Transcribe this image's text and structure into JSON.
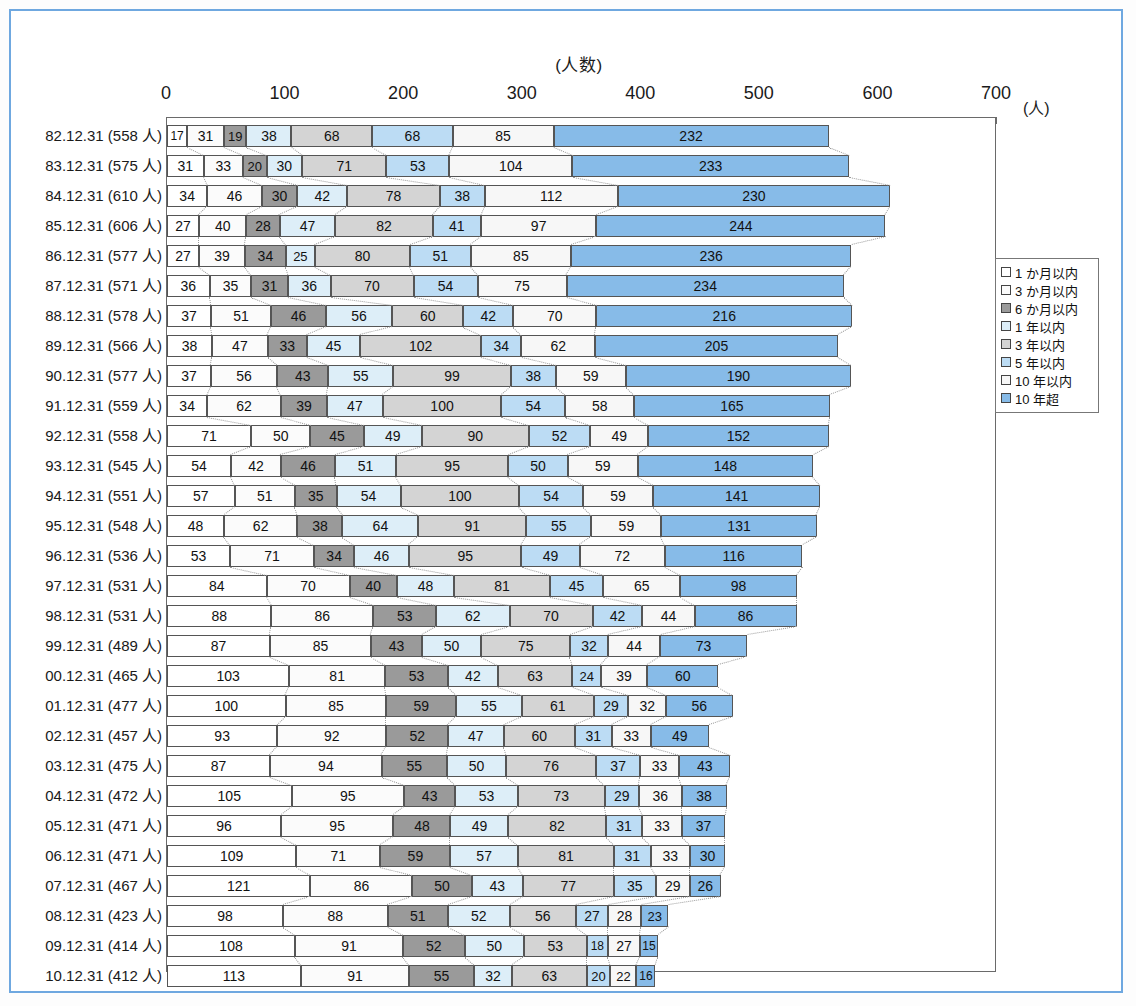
{
  "chart_data": {
    "type": "bar",
    "orientation": "horizontal",
    "stacked": true,
    "title": "(人数)",
    "xlabel": "(人)",
    "ylabel": "",
    "xlim": [
      0,
      700
    ],
    "xticks": [
      0,
      100,
      200,
      300,
      400,
      500,
      600,
      700
    ],
    "grid": false,
    "legend_position": "right",
    "series": [
      {
        "name": "1 か月以内",
        "color": "#ffffff"
      },
      {
        "name": "3 か月以内",
        "color": "#fbfbfb"
      },
      {
        "name": "6 か月以内",
        "color": "#9a9a9a"
      },
      {
        "name": "1 年以内",
        "color": "#ddeef8"
      },
      {
        "name": "3 年以内",
        "color": "#d4d4d4"
      },
      {
        "name": "5 年以内",
        "color": "#bcdcf4"
      },
      {
        "name": "10 年以内",
        "color": "#f7f7f7"
      },
      {
        "name": "10 年超",
        "color": "#87bbe8"
      }
    ],
    "categories": [
      "82.12.31 (558 人)",
      "83.12.31 (575 人)",
      "84.12.31 (610 人)",
      "85.12.31 (606 人)",
      "86.12.31 (577 人)",
      "87.12.31 (571 人)",
      "88.12.31 (578 人)",
      "89.12.31 (566 人)",
      "90.12.31 (577 人)",
      "91.12.31 (559 人)",
      "92.12.31 (558 人)",
      "93.12.31 (545 人)",
      "94.12.31 (551 人)",
      "95.12.31 (548 人)",
      "96.12.31 (536 人)",
      "97.12.31 (531 人)",
      "98.12.31 (531 人)",
      "99.12.31 (489 人)",
      "00.12.31 (465 人)",
      "01.12.31 (477 人)",
      "02.12.31 (457 人)",
      "03.12.31 (475 人)",
      "04.12.31 (472 人)",
      "05.12.31 (471 人)",
      "06.12.31 (471 人)",
      "07.12.31 (467 人)",
      "08.12.31 (423 人)",
      "09.12.31 (414 人)",
      "10.12.31 (412 人)"
    ],
    "rows": [
      {
        "label": "82.12.31 (558 人)",
        "total": 558,
        "values": [
          17,
          31,
          19,
          38,
          68,
          68,
          85,
          232
        ]
      },
      {
        "label": "83.12.31 (575 人)",
        "total": 575,
        "values": [
          31,
          33,
          20,
          30,
          71,
          53,
          104,
          233
        ]
      },
      {
        "label": "84.12.31 (610 人)",
        "total": 610,
        "values": [
          34,
          46,
          30,
          42,
          78,
          38,
          112,
          230
        ]
      },
      {
        "label": "85.12.31 (606 人)",
        "total": 606,
        "values": [
          27,
          40,
          28,
          47,
          82,
          41,
          97,
          244
        ]
      },
      {
        "label": "86.12.31 (577 人)",
        "total": 577,
        "values": [
          27,
          39,
          34,
          25,
          80,
          51,
          85,
          236
        ]
      },
      {
        "label": "87.12.31 (571 人)",
        "total": 571,
        "values": [
          36,
          35,
          31,
          36,
          70,
          54,
          75,
          234
        ]
      },
      {
        "label": "88.12.31 (578 人)",
        "total": 578,
        "values": [
          37,
          51,
          46,
          56,
          60,
          42,
          70,
          216
        ]
      },
      {
        "label": "89.12.31 (566 人)",
        "total": 566,
        "values": [
          38,
          47,
          33,
          45,
          102,
          34,
          62,
          205
        ]
      },
      {
        "label": "90.12.31 (577 人)",
        "total": 577,
        "values": [
          37,
          56,
          43,
          55,
          99,
          38,
          59,
          190
        ]
      },
      {
        "label": "91.12.31 (559 人)",
        "total": 559,
        "values": [
          34,
          62,
          39,
          47,
          100,
          54,
          58,
          165
        ]
      },
      {
        "label": "92.12.31 (558 人)",
        "total": 558,
        "values": [
          71,
          50,
          45,
          49,
          90,
          52,
          49,
          152
        ]
      },
      {
        "label": "93.12.31 (545 人)",
        "total": 545,
        "values": [
          54,
          42,
          46,
          51,
          95,
          50,
          59,
          148
        ]
      },
      {
        "label": "94.12.31 (551 人)",
        "total": 551,
        "values": [
          57,
          51,
          35,
          54,
          100,
          54,
          59,
          141
        ]
      },
      {
        "label": "95.12.31 (548 人)",
        "total": 548,
        "values": [
          48,
          62,
          38,
          64,
          91,
          55,
          59,
          131
        ]
      },
      {
        "label": "96.12.31 (536 人)",
        "total": 536,
        "values": [
          53,
          71,
          34,
          46,
          95,
          49,
          72,
          116
        ]
      },
      {
        "label": "97.12.31 (531 人)",
        "total": 531,
        "values": [
          84,
          70,
          40,
          48,
          81,
          45,
          65,
          98
        ]
      },
      {
        "label": "98.12.31 (531 人)",
        "total": 531,
        "values": [
          88,
          86,
          53,
          62,
          70,
          42,
          44,
          86
        ]
      },
      {
        "label": "99.12.31 (489 人)",
        "total": 489,
        "values": [
          87,
          85,
          43,
          50,
          75,
          32,
          44,
          73
        ]
      },
      {
        "label": "00.12.31 (465 人)",
        "total": 465,
        "values": [
          103,
          81,
          53,
          42,
          63,
          24,
          39,
          60
        ]
      },
      {
        "label": "01.12.31 (477 人)",
        "total": 477,
        "values": [
          100,
          85,
          59,
          55,
          61,
          29,
          32,
          56
        ]
      },
      {
        "label": "02.12.31 (457 人)",
        "total": 457,
        "values": [
          93,
          92,
          52,
          47,
          60,
          31,
          33,
          49
        ]
      },
      {
        "label": "03.12.31 (475 人)",
        "total": 475,
        "values": [
          87,
          94,
          55,
          50,
          76,
          37,
          33,
          43
        ]
      },
      {
        "label": "04.12.31 (472 人)",
        "total": 472,
        "values": [
          105,
          95,
          43,
          53,
          73,
          29,
          36,
          38
        ]
      },
      {
        "label": "05.12.31 (471 人)",
        "total": 471,
        "values": [
          96,
          95,
          48,
          49,
          82,
          31,
          33,
          37
        ]
      },
      {
        "label": "06.12.31 (471 人)",
        "total": 471,
        "values": [
          109,
          71,
          59,
          57,
          81,
          31,
          33,
          30
        ]
      },
      {
        "label": "07.12.31 (467 人)",
        "total": 467,
        "values": [
          121,
          86,
          50,
          43,
          77,
          35,
          29,
          26
        ]
      },
      {
        "label": "08.12.31 (423 人)",
        "total": 423,
        "values": [
          98,
          88,
          51,
          52,
          56,
          27,
          28,
          23
        ]
      },
      {
        "label": "09.12.31 (414 人)",
        "total": 414,
        "values": [
          108,
          91,
          52,
          50,
          53,
          18,
          27,
          15
        ]
      },
      {
        "label": "10.12.31 (412 人)",
        "total": 412,
        "values": [
          113,
          91,
          55,
          32,
          63,
          20,
          22,
          16
        ]
      }
    ]
  },
  "legend": {
    "items": [
      {
        "label": "1 か月以内",
        "color": "#ffffff"
      },
      {
        "label": "3 か月以内",
        "color": "#fbfbfb"
      },
      {
        "label": "6 か月以内",
        "color": "#9a9a9a"
      },
      {
        "label": "1 年以内",
        "color": "#ddeef8"
      },
      {
        "label": "3 年以内",
        "color": "#d4d4d4"
      },
      {
        "label": "5 年以内",
        "color": "#bcdcf4"
      },
      {
        "label": "10 年以内",
        "color": "#f7f7f7"
      },
      {
        "label": "10 年超",
        "color": "#87bbe8"
      }
    ]
  },
  "axis": {
    "title": "(人数)",
    "unit": "(人)",
    "ticks": [
      "0",
      "100",
      "200",
      "300",
      "400",
      "500",
      "600",
      "700"
    ]
  },
  "colors": {
    "frame_border": "#6fa8e0",
    "plot_border": "#6a6a6a",
    "segment_border": "#555555",
    "connector": "#9a9a9a",
    "text": "#1a1a1a"
  }
}
